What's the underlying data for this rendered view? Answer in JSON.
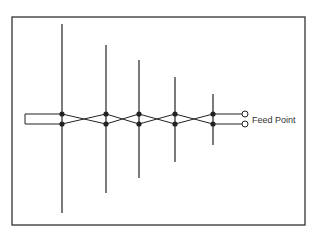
{
  "diagram": {
    "feed_label": "Feed Point",
    "frame": {
      "x": 12,
      "y": 17,
      "w": 293,
      "h": 208
    },
    "feed_lines_y": [
      114,
      124
    ],
    "boom_start_x": 25,
    "elements": [
      {
        "x": 62,
        "top": 24,
        "bottom": 213
      },
      {
        "x": 106,
        "top": 45,
        "bottom": 193
      },
      {
        "x": 139,
        "top": 60,
        "bottom": 178
      },
      {
        "x": 175,
        "top": 77,
        "bottom": 162
      },
      {
        "x": 213,
        "top": 94,
        "bottom": 145
      }
    ],
    "terminals_x": 245,
    "colors": {
      "line": "#222222",
      "frame": "#333333"
    }
  }
}
